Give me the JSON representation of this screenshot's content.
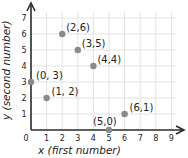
{
  "chart_data": {
    "type": "scatter",
    "title": "",
    "xlabel": "x (first number)",
    "ylabel": "y (second number)",
    "xlim": [
      0,
      9
    ],
    "ylim": [
      0,
      7
    ],
    "grid": true,
    "x_ticks": [
      "0",
      "1",
      "2",
      "3",
      "4",
      "5",
      "6",
      "7",
      "8",
      "9"
    ],
    "y_ticks": [
      "1",
      "2",
      "3",
      "4",
      "5",
      "6",
      "7"
    ],
    "points": [
      {
        "x": 0,
        "y": 3,
        "label": "(0, 3)"
      },
      {
        "x": 1,
        "y": 2,
        "label": "(1, 2)"
      },
      {
        "x": 2,
        "y": 6,
        "label": "(2,6)"
      },
      {
        "x": 3,
        "y": 5,
        "label": "(3,5)"
      },
      {
        "x": 4,
        "y": 4,
        "label": "(4,4)"
      },
      {
        "x": 5,
        "y": 0,
        "label": "(5,0)"
      },
      {
        "x": 6,
        "y": 1,
        "label": "(6,1)"
      }
    ],
    "colors": {
      "point": "#8a8a8a",
      "grid": "#e2e2e2",
      "axis": "#2a2a2a"
    }
  }
}
